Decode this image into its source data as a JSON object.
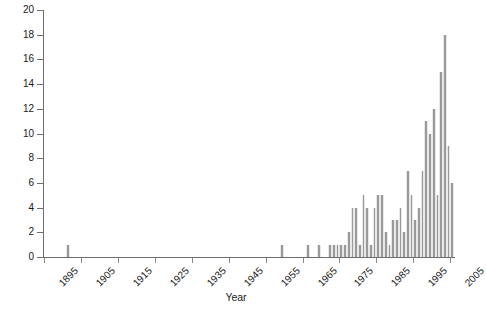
{
  "chart_data": {
    "type": "bar",
    "title": "",
    "xlabel": "Year",
    "ylabel": "Number of Cases",
    "xlim": [
      1895,
      2006
    ],
    "ylim": [
      0,
      20
    ],
    "ytick_values": [
      0,
      2,
      4,
      6,
      8,
      10,
      12,
      14,
      16,
      18,
      20
    ],
    "xtick_values": [
      1895,
      1905,
      1915,
      1925,
      1935,
      1945,
      1955,
      1965,
      1975,
      1985,
      1995,
      2005
    ],
    "xtick_labels": [
      "1895",
      "1905",
      "1915",
      "1925",
      "1935",
      "1945",
      "1955",
      "1965",
      "1975",
      "1985",
      "1995",
      "2005"
    ],
    "ytick_labels": [
      "0",
      "2",
      "4",
      "6",
      "8",
      "10",
      "12",
      "14",
      "16",
      "18",
      "20"
    ],
    "grid": false,
    "legend": false,
    "bar_color": "#9a9a9a",
    "axis_color": "#6e6e6e",
    "categories": [
      1901,
      1959,
      1966,
      1969,
      1972,
      1973,
      1974,
      1975,
      1976,
      1977,
      1978,
      1979,
      1980,
      1981,
      1982,
      1983,
      1984,
      1985,
      1986,
      1987,
      1988,
      1989,
      1990,
      1991,
      1992,
      1993,
      1994,
      1995,
      1996,
      1997,
      1998,
      1999,
      2000,
      2001,
      2002,
      2003,
      2004,
      2005
    ],
    "values": [
      1,
      1,
      1,
      1,
      1,
      1,
      1,
      1,
      1,
      2,
      4,
      4,
      1,
      5,
      4,
      1,
      4,
      5,
      5,
      2,
      1,
      3,
      3,
      4,
      2,
      7,
      5,
      3,
      4,
      7,
      11,
      10,
      12,
      5,
      15,
      18,
      9,
      6
    ]
  },
  "axis": {
    "ylabel": "Number of Cases",
    "xlabel": "Year"
  }
}
